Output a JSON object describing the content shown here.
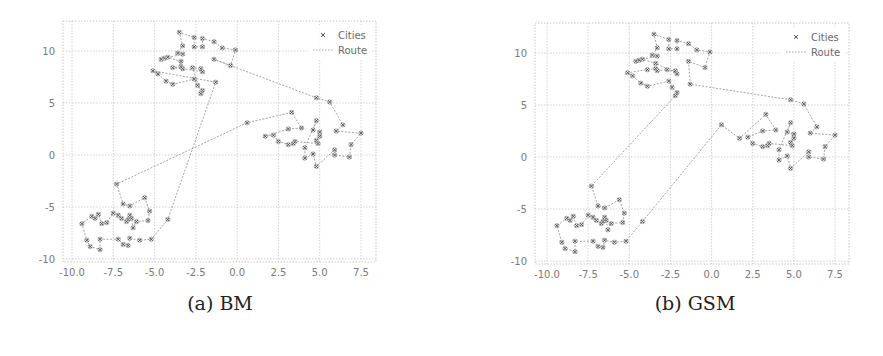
{
  "chart_data": [
    {
      "type": "scatter",
      "panel": "a",
      "caption": "(a) BM",
      "title": "",
      "xlabel": "",
      "ylabel": "",
      "xlim": [
        -10.3,
        8.3
      ],
      "ylim": [
        -10,
        12.9
      ],
      "xticks": [
        -10.0,
        -7.5,
        -5.0,
        -2.5,
        0.0,
        2.5,
        5.0,
        7.5
      ],
      "xtick_labels": [
        "-10.0",
        "-7.5",
        "-5.0",
        "-2.5",
        "0.0",
        "2.5",
        "5.0",
        "7.5"
      ],
      "yticks": [
        -10,
        -5,
        0,
        5,
        10
      ],
      "ytick_labels": [
        "-10",
        "-5",
        "0",
        "5",
        "10"
      ],
      "grid": true,
      "legend": {
        "position": "upper right",
        "entries": [
          "Cities",
          "Route"
        ]
      },
      "series": [
        {
          "name": "Cities",
          "marker": "x",
          "ref": "cities"
        },
        {
          "name": "Route",
          "style": "dotted",
          "ref": "route_bm"
        }
      ]
    },
    {
      "type": "scatter",
      "panel": "b",
      "caption": "(b) GSM",
      "title": "",
      "xlabel": "",
      "ylabel": "",
      "xlim": [
        -10.3,
        8.3
      ],
      "ylim": [
        -10,
        12.9
      ],
      "xticks": [
        -10.0,
        -7.5,
        -5.0,
        -2.5,
        0.0,
        2.5,
        5.0,
        7.5
      ],
      "xtick_labels": [
        "-10.0",
        "-7.5",
        "-5.0",
        "-2.5",
        "0.0",
        "2.5",
        "5.0",
        "7.5"
      ],
      "yticks": [
        -10,
        -5,
        0,
        5,
        10
      ],
      "ytick_labels": [
        "-10",
        "-5",
        "0",
        "5",
        "10"
      ],
      "grid": true,
      "legend": {
        "position": "upper right",
        "entries": [
          "Cities",
          "Route"
        ]
      },
      "series": [
        {
          "name": "Cities",
          "marker": "x",
          "ref": "cities"
        },
        {
          "name": "Route",
          "style": "dotted",
          "ref": "route_gsm"
        }
      ]
    }
  ],
  "cities": [
    [
      -3.5,
      11.8
    ],
    [
      -2.6,
      11.3
    ],
    [
      -2.1,
      11.2
    ],
    [
      -1.4,
      10.9
    ],
    [
      -0.9,
      10.3
    ],
    [
      -0.1,
      10.1
    ],
    [
      -0.4,
      8.6
    ],
    [
      -1.4,
      9.2
    ],
    [
      -2.6,
      10.4
    ],
    [
      -2.1,
      10.4
    ],
    [
      -3.3,
      10.5
    ],
    [
      -3.6,
      9.8
    ],
    [
      -3.3,
      9.7
    ],
    [
      -4.4,
      9.3
    ],
    [
      -4.6,
      9.2
    ],
    [
      -4.2,
      9.4
    ],
    [
      -3.4,
      9.0
    ],
    [
      -3.4,
      8.5
    ],
    [
      -3.9,
      8.4
    ],
    [
      -3.3,
      8.3
    ],
    [
      -2.7,
      8.4
    ],
    [
      -2.2,
      8.3
    ],
    [
      -2.1,
      8.0
    ],
    [
      -5.1,
      8.1
    ],
    [
      -4.8,
      7.8
    ],
    [
      -4.3,
      7.1
    ],
    [
      -3.9,
      6.8
    ],
    [
      -2.6,
      7.3
    ],
    [
      -2.4,
      6.7
    ],
    [
      -1.3,
      7.0
    ],
    [
      -2.1,
      6.2
    ],
    [
      -2.2,
      5.9
    ],
    [
      4.8,
      5.5
    ],
    [
      5.6,
      5.1
    ],
    [
      6.4,
      2.9
    ],
    [
      6.0,
      2.3
    ],
    [
      7.5,
      2.1
    ],
    [
      6.9,
      1.0
    ],
    [
      6.8,
      -0.2
    ],
    [
      5.9,
      0.0
    ],
    [
      5.9,
      0.5
    ],
    [
      4.8,
      -1.1
    ],
    [
      4.6,
      0.1
    ],
    [
      4.1,
      -0.3
    ],
    [
      4.1,
      0.7
    ],
    [
      4.8,
      3.3
    ],
    [
      4.6,
      2.4
    ],
    [
      5.0,
      2.2
    ],
    [
      5.0,
      1.8
    ],
    [
      4.8,
      1.4
    ],
    [
      4.9,
      1.1
    ],
    [
      3.5,
      1.3
    ],
    [
      3.4,
      1.1
    ],
    [
      3.1,
      1.0
    ],
    [
      2.5,
      1.3
    ],
    [
      2.2,
      1.9
    ],
    [
      1.7,
      1.8
    ],
    [
      3.1,
      2.5
    ],
    [
      3.9,
      2.6
    ],
    [
      3.3,
      4.1
    ],
    [
      0.6,
      3.1
    ],
    [
      -7.3,
      -2.8
    ],
    [
      -6.9,
      -4.7
    ],
    [
      -6.5,
      -4.9
    ],
    [
      -5.6,
      -4.1
    ],
    [
      -5.3,
      -5.4
    ],
    [
      -5.4,
      -6.3
    ],
    [
      -6.1,
      -6.4
    ],
    [
      -6.3,
      -7.0
    ],
    [
      -6.4,
      -6.1
    ],
    [
      -6.5,
      -5.8
    ],
    [
      -6.6,
      -6.2
    ],
    [
      -6.7,
      -6.4
    ],
    [
      -7.0,
      -6.1
    ],
    [
      -7.2,
      -5.8
    ],
    [
      -7.5,
      -5.6
    ],
    [
      -7.9,
      -6.5
    ],
    [
      -8.2,
      -6.6
    ],
    [
      -8.4,
      -5.7
    ],
    [
      -8.6,
      -6.1
    ],
    [
      -8.8,
      -5.9
    ],
    [
      -9.4,
      -6.6
    ],
    [
      -9.1,
      -8.2
    ],
    [
      -8.9,
      -8.8
    ],
    [
      -8.3,
      -9.1
    ],
    [
      -8.3,
      -8.1
    ],
    [
      -7.2,
      -8.1
    ],
    [
      -6.9,
      -8.6
    ],
    [
      -6.6,
      -8.7
    ],
    [
      -6.5,
      -8.0
    ],
    [
      -5.9,
      -8.2
    ],
    [
      -5.2,
      -8.1
    ],
    [
      -4.2,
      -6.2
    ]
  ],
  "route_bm": [
    29,
    23,
    24,
    25,
    26,
    27,
    28,
    30,
    31,
    20,
    21,
    22,
    19,
    18,
    17,
    16,
    15,
    14,
    13,
    12,
    11,
    10,
    0,
    1,
    8,
    9,
    2,
    3,
    4,
    5,
    6,
    7,
    32,
    33,
    34,
    35,
    36,
    37,
    38,
    39,
    40,
    41,
    42,
    43,
    44,
    45,
    46,
    47,
    48,
    49,
    50,
    51,
    52,
    53,
    54,
    55,
    56,
    57,
    58,
    59,
    60,
    61,
    62,
    63,
    64,
    65,
    66,
    67,
    68,
    69,
    70,
    71,
    72,
    73,
    74,
    75,
    76,
    77,
    78,
    79,
    80,
    81,
    82,
    83,
    84,
    85,
    86,
    87,
    88,
    89,
    90,
    91,
    92,
    29
  ],
  "route_gsm": [
    31,
    30,
    28,
    27,
    26,
    25,
    24,
    23,
    18,
    17,
    19,
    20,
    21,
    22,
    16,
    15,
    14,
    13,
    12,
    11,
    10,
    0,
    1,
    8,
    9,
    2,
    3,
    4,
    5,
    6,
    7,
    29,
    32,
    33,
    34,
    35,
    36,
    37,
    38,
    39,
    40,
    41,
    42,
    43,
    44,
    45,
    46,
    47,
    48,
    49,
    50,
    51,
    52,
    53,
    54,
    55,
    57,
    58,
    59,
    56,
    60,
    92,
    91,
    90,
    89,
    88,
    87,
    86,
    85,
    84,
    83,
    82,
    81,
    80,
    79,
    78,
    77,
    76,
    75,
    74,
    73,
    72,
    71,
    70,
    69,
    68,
    67,
    66,
    65,
    64,
    63,
    62,
    61,
    31
  ],
  "legend_labels": {
    "cities": "Cities",
    "route": "Route"
  },
  "captions": {
    "a": "(a) BM",
    "b": "(b) GSM"
  },
  "colors": {
    "marker": "#555555",
    "route": "#9a9a9a",
    "grid": "#c8c8c8",
    "tick": "#7a7a7a"
  }
}
